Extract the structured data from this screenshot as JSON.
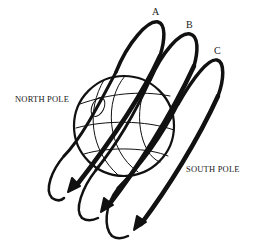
{
  "diagram": {
    "type": "orbital-paths-around-earth",
    "colors": {
      "ink": "#111111",
      "background": "#ffffff"
    },
    "labels": {
      "north_pole": "NORTH POLE",
      "south_pole": "SOUTH POLE"
    },
    "orbits": [
      {
        "id": "A",
        "label": "A"
      },
      {
        "id": "B",
        "label": "B"
      },
      {
        "id": "C",
        "label": "C"
      }
    ],
    "globe": {
      "shape": "sphere-with-meridians-and-parallels"
    }
  }
}
